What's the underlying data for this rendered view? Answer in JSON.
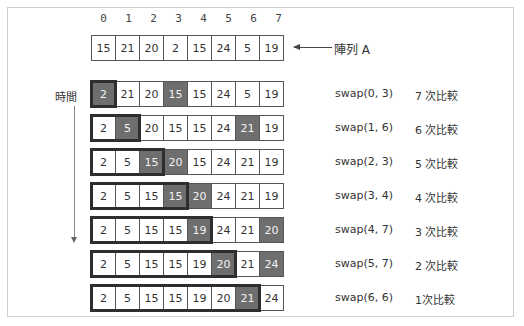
{
  "indices": [
    "0",
    "1",
    "2",
    "3",
    "4",
    "5",
    "6",
    "7"
  ],
  "initial_array": {
    "label": "陣列 A",
    "values": [
      "15",
      "21",
      "20",
      "2",
      "15",
      "24",
      "5",
      "19"
    ]
  },
  "time_label": "時間",
  "steps": [
    {
      "values": [
        "2",
        "21",
        "20",
        "15",
        "15",
        "24",
        "5",
        "19"
      ],
      "highlight": [
        0,
        3
      ],
      "sorted_through": 0,
      "operation": "swap(0, 3)",
      "comparisons": "7 次比較"
    },
    {
      "values": [
        "2",
        "5",
        "20",
        "15",
        "15",
        "24",
        "21",
        "19"
      ],
      "highlight": [
        1,
        6
      ],
      "sorted_through": 1,
      "operation": "swap(1, 6)",
      "comparisons": "6 次比較"
    },
    {
      "values": [
        "2",
        "5",
        "15",
        "20",
        "15",
        "24",
        "21",
        "19"
      ],
      "highlight": [
        2,
        3
      ],
      "sorted_through": 2,
      "operation": "swap(2, 3)",
      "comparisons": "5 次比較"
    },
    {
      "values": [
        "2",
        "5",
        "15",
        "15",
        "20",
        "24",
        "21",
        "19"
      ],
      "highlight": [
        3,
        4
      ],
      "sorted_through": 3,
      "operation": "swap(3, 4)",
      "comparisons": "4 次比較"
    },
    {
      "values": [
        "2",
        "5",
        "15",
        "15",
        "19",
        "24",
        "21",
        "20"
      ],
      "highlight": [
        4,
        7
      ],
      "sorted_through": 4,
      "operation": "swap(4, 7)",
      "comparisons": "3 次比較"
    },
    {
      "values": [
        "2",
        "5",
        "15",
        "15",
        "19",
        "20",
        "21",
        "24"
      ],
      "highlight": [
        5,
        7
      ],
      "sorted_through": 5,
      "operation": "swap(5, 7)",
      "comparisons": "2 次比較"
    },
    {
      "values": [
        "2",
        "5",
        "15",
        "15",
        "19",
        "20",
        "21",
        "24"
      ],
      "highlight": [
        6
      ],
      "sorted_through": 6,
      "operation": "swap(6, 6)",
      "comparisons": "1次比較"
    }
  ],
  "colors": {
    "highlight_fill": "#6e6e6e",
    "bracket_border": "#2e2e2e",
    "cell_border": "#555555"
  }
}
